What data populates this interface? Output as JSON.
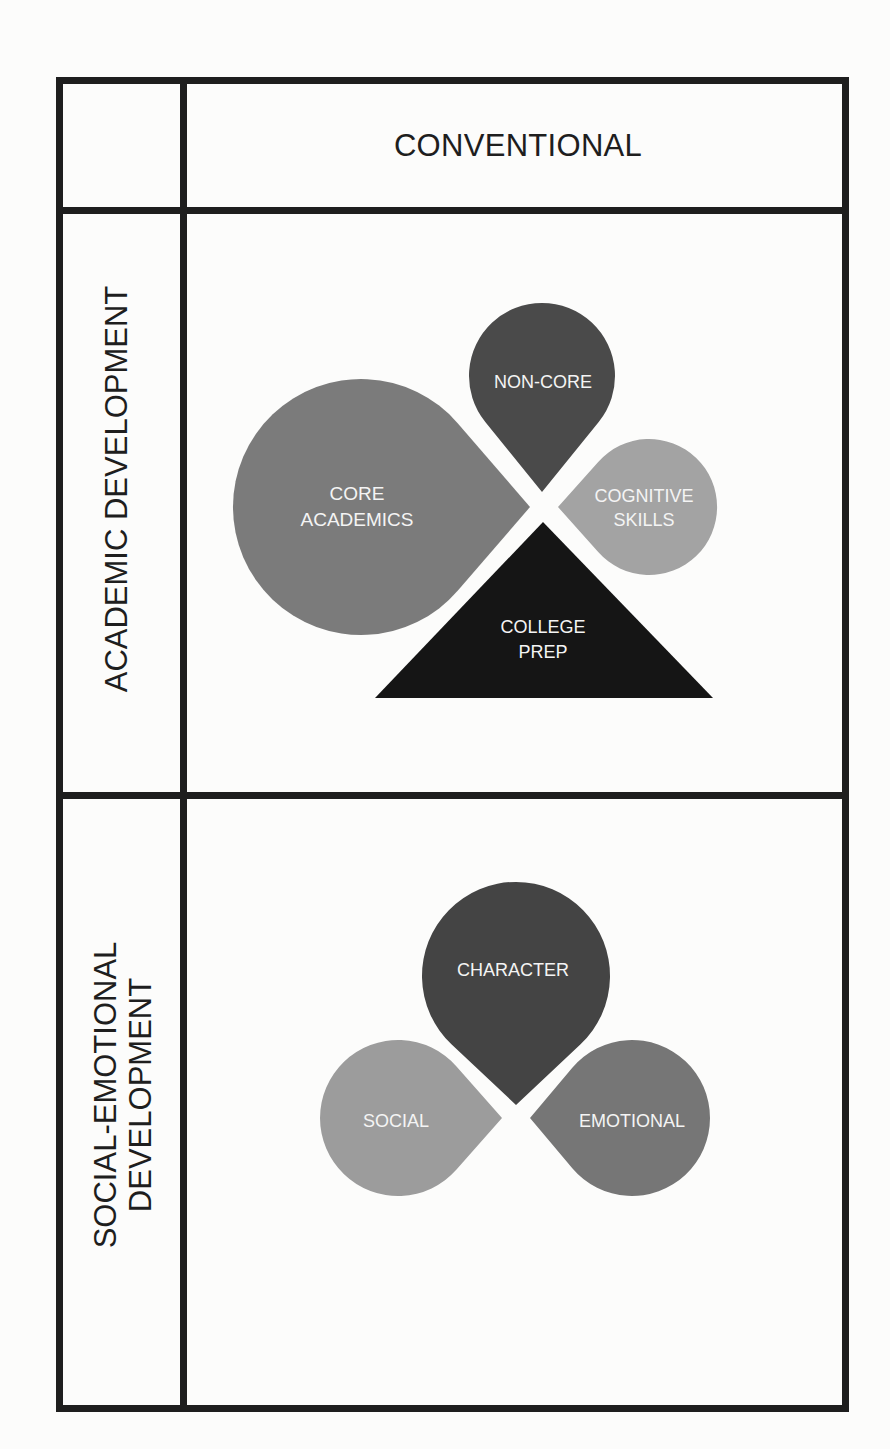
{
  "header": {
    "column_title": "CONVENTIONAL"
  },
  "rows": [
    {
      "label_lines": [
        "ACADEMIC DEVELOPMENT"
      ],
      "shapes": [
        {
          "id": "non-core",
          "lines": [
            "NON-CORE"
          ],
          "shape": "teardrop-down",
          "color": "#4a4a4a"
        },
        {
          "id": "core-academics",
          "lines": [
            "CORE",
            "ACADEMICS"
          ],
          "shape": "teardrop-right",
          "color": "#7b7b7b"
        },
        {
          "id": "cognitive-skills",
          "lines": [
            "COGNITIVE",
            "SKILLS"
          ],
          "shape": "teardrop-left",
          "color": "#a3a3a3"
        },
        {
          "id": "college-prep",
          "lines": [
            "COLLEGE",
            "PREP"
          ],
          "shape": "triangle",
          "color": "#151515"
        }
      ]
    },
    {
      "label_lines": [
        "SOCIAL-EMOTIONAL",
        "DEVELOPMENT"
      ],
      "shapes": [
        {
          "id": "character",
          "lines": [
            "CHARACTER"
          ],
          "shape": "teardrop-down",
          "color": "#444444"
        },
        {
          "id": "social",
          "lines": [
            "SOCIAL"
          ],
          "shape": "teardrop-right",
          "color": "#9c9c9c"
        },
        {
          "id": "emotional",
          "lines": [
            "EMOTIONAL"
          ],
          "shape": "teardrop-left",
          "color": "#767676"
        }
      ]
    }
  ],
  "colors": {
    "border": "#1e1e1e",
    "background": "#fcfcfb",
    "shape_text": "#f4f4f4"
  }
}
